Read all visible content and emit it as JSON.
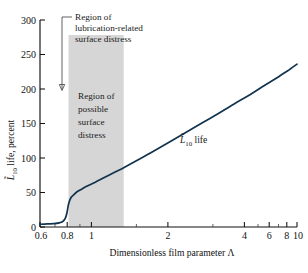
{
  "chart_data": {
    "type": "line",
    "title": "",
    "xlabel": "Dimensionless film parameter Λ",
    "ylabel": "L̃₁₀ life, percent",
    "xscale": "log",
    "xlim": [
      0.6,
      10
    ],
    "ylim": [
      0,
      300
    ],
    "grid": false,
    "legend_position": "inline-annotation",
    "x_ticks": [
      "0.6",
      "0.8",
      "1",
      "2",
      "4",
      "6",
      "8",
      "10"
    ],
    "x_tick_values": [
      0.6,
      0.8,
      1,
      2,
      4,
      6,
      8,
      10
    ],
    "x_minor_ticks": [
      0.7,
      0.9,
      1.5,
      3,
      5,
      7,
      9
    ],
    "y_ticks": [
      "0",
      "50",
      "100",
      "150",
      "200",
      "250",
      "300"
    ],
    "y_tick_values": [
      0,
      50,
      100,
      150,
      200,
      250,
      300
    ],
    "series": [
      {
        "name": "L̃₁₀ life",
        "x": [
          0.6,
          0.65,
          0.7,
          0.74,
          0.77,
          0.79,
          0.805,
          0.82,
          0.84,
          0.87,
          0.9,
          0.95,
          1.0,
          1.1,
          1.2,
          1.35,
          1.5,
          1.75,
          2.0,
          2.5,
          3.0,
          3.5,
          4.0,
          5.0,
          6.0,
          7.0,
          8.0,
          9.0,
          10.0
        ],
        "y": [
          4,
          4.5,
          5,
          6,
          8,
          12,
          20,
          33,
          42,
          47,
          51,
          55,
          59,
          65,
          71,
          79,
          86,
          97,
          107,
          124,
          138,
          150,
          160,
          178,
          192,
          205,
          216,
          226,
          236
        ]
      }
    ],
    "shaded_regions": [
      {
        "name": "region-of-possible-surface-distress",
        "x_start": 0.82,
        "x_end": 1.5,
        "color": "#d6d6d6"
      }
    ],
    "annotations": [
      {
        "name": "lubrication-distress-annotation",
        "lines": [
          "Region of",
          "lubrication-related",
          "surface distress"
        ]
      },
      {
        "name": "possible-distress-annotation",
        "lines": [
          "Region of",
          "possible",
          "surface",
          "distress"
        ]
      },
      {
        "name": "curve-label",
        "text_prefix": "L",
        "text_sub": "10",
        "text_suffix": " life"
      }
    ],
    "colors": {
      "curve": "#11334d",
      "band": "#d6d6d6",
      "axis": "#111111",
      "text": "#1a1a1a"
    }
  }
}
